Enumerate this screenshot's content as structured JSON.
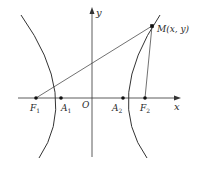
{
  "figure": {
    "type": "hyperbola-focal-diagram",
    "colors": {
      "stroke": "#333333",
      "background": "#ffffff"
    },
    "axes": {
      "x_label": "x",
      "y_label": "y",
      "origin_label": "O"
    },
    "points": {
      "F1": {
        "label": "F",
        "sub": "1"
      },
      "A1": {
        "label": "A",
        "sub": "1"
      },
      "A2": {
        "label": "A",
        "sub": "2"
      },
      "F2": {
        "label": "F",
        "sub": "2"
      },
      "M": {
        "label": "M(x, y)"
      }
    },
    "segments": [
      "F1-M",
      "F2-M"
    ],
    "curves": [
      "left-branch",
      "right-branch"
    ]
  }
}
